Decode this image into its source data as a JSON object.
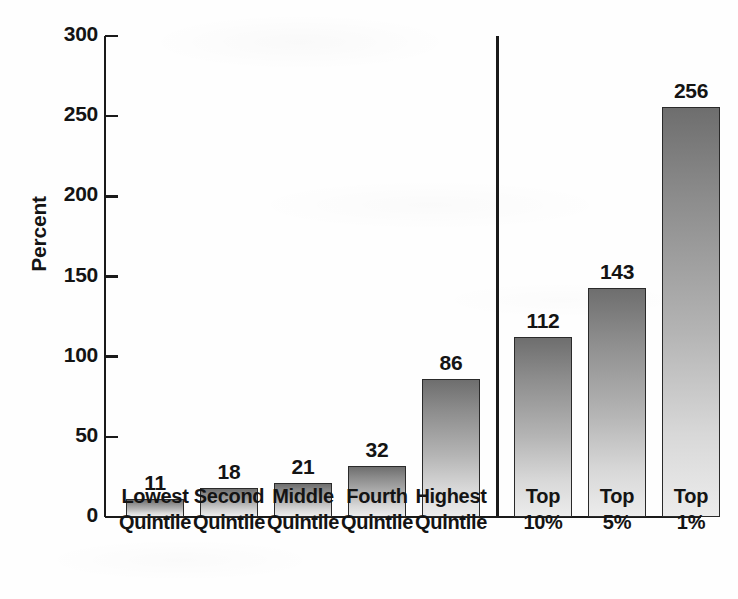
{
  "chart_data": {
    "type": "bar",
    "title": "",
    "subtitle": "",
    "xlabel": "",
    "ylabel": "Percent",
    "ylim": [
      0,
      300
    ],
    "yticks": [
      0,
      50,
      100,
      150,
      200,
      250,
      300
    ],
    "ytick_labels": [
      "0",
      "50",
      "100",
      "150",
      "200",
      "250",
      "300"
    ],
    "grid": false,
    "legend": null,
    "categories": [
      "Lowest Quintile",
      "Second Quintile",
      "Middle Quintile",
      "Fourth Quintile",
      "Highest Quintile",
      "Top 10%",
      "Top 5%",
      "Top 1%"
    ],
    "category_lines": [
      [
        "Lowest",
        "Quintile"
      ],
      [
        "Second",
        "Quintile"
      ],
      [
        "Middle",
        "Quintile"
      ],
      [
        "Fourth",
        "Quintile"
      ],
      [
        "Highest",
        "Quintile"
      ],
      [
        "Top",
        "10%"
      ],
      [
        "Top",
        "5%"
      ],
      [
        "Top",
        "1%"
      ]
    ],
    "values": [
      11,
      18,
      21,
      32,
      86,
      112,
      143,
      256
    ],
    "value_labels": [
      "11",
      "18",
      "21",
      "32",
      "86",
      "112",
      "143",
      "256"
    ],
    "bar_fill_top_color": "#6e6e6e",
    "bar_fill_bottom_color": "#ececec",
    "bar_outline_color": "#2a2a2a",
    "axis_color": "#1a1a1a",
    "group_divider_after_index": 4,
    "groups": [
      {
        "name": "quintiles",
        "start_index": 0,
        "end_index": 4
      },
      {
        "name": "top-shares",
        "start_index": 5,
        "end_index": 7
      }
    ]
  }
}
